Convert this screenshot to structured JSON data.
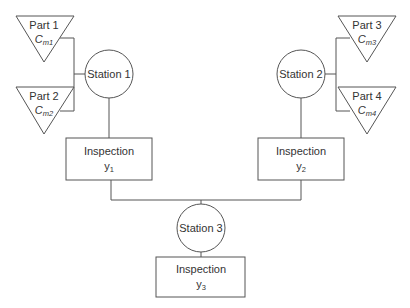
{
  "diagram": {
    "parts": [
      {
        "id": "part1",
        "label": "Part 1",
        "symbol": "C",
        "subscript": "m1"
      },
      {
        "id": "part2",
        "label": "Part 2",
        "symbol": "C",
        "subscript": "m2"
      },
      {
        "id": "part3",
        "label": "Part 3",
        "symbol": "C",
        "subscript": "m3"
      },
      {
        "id": "part4",
        "label": "Part 4",
        "symbol": "C",
        "subscript": "m4"
      }
    ],
    "stations": [
      {
        "id": "station1",
        "label": "Station 1"
      },
      {
        "id": "station2",
        "label": "Station 2"
      },
      {
        "id": "station3",
        "label": "Station 3"
      }
    ],
    "inspections": [
      {
        "id": "inspection1",
        "label": "Inspection",
        "var": "y",
        "subscript": "1"
      },
      {
        "id": "inspection2",
        "label": "Inspection",
        "var": "y",
        "subscript": "2"
      },
      {
        "id": "inspection3",
        "label": "Inspection",
        "var": "y",
        "subscript": "3"
      }
    ],
    "colors": {
      "line": "#555555",
      "text": "#333333",
      "background": "#ffffff"
    }
  }
}
